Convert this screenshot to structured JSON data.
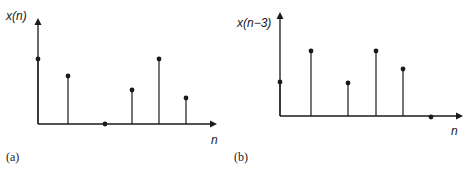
{
  "panels": [
    {
      "id": "a",
      "ylabel": "x(n)",
      "xlabel": "n",
      "caption": "(a)",
      "origin": [
        38,
        124
      ],
      "axis_top": 18,
      "axis_right": 217,
      "stems": [
        {
          "x": 38,
          "y": 59
        },
        {
          "x": 68,
          "y": 76
        },
        {
          "x": 105,
          "y": 124
        },
        {
          "x": 132,
          "y": 90
        },
        {
          "x": 159,
          "y": 59
        },
        {
          "x": 186,
          "y": 98
        }
      ]
    },
    {
      "id": "b",
      "ylabel": "x(n−3)",
      "xlabel": "n",
      "caption": "(b)",
      "origin": [
        280,
        116
      ],
      "axis_top": 12,
      "axis_right": 463,
      "stems": [
        {
          "x": 280,
          "y": 82
        },
        {
          "x": 311,
          "y": 51
        },
        {
          "x": 348,
          "y": 83
        },
        {
          "x": 376,
          "y": 51
        },
        {
          "x": 403,
          "y": 69
        },
        {
          "x": 431,
          "y": 117
        }
      ]
    }
  ],
  "colors": {
    "ink": "#1a1a1a"
  }
}
